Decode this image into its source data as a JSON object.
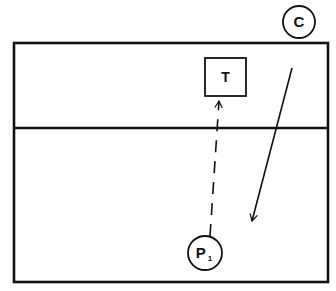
{
  "diagram": {
    "type": "court-play-diagram",
    "court": {
      "outer": {
        "x": 14,
        "y": 43,
        "width": 314,
        "height": 239
      },
      "divider_y": 128,
      "stroke": "#111111"
    },
    "players": [
      {
        "id": "C",
        "label": "C",
        "subscript": "",
        "shape": "circle",
        "cx": 299,
        "cy": 22,
        "r": 16
      },
      {
        "id": "P1",
        "label": "P",
        "subscript": "1",
        "shape": "circle",
        "cx": 205,
        "cy": 253,
        "r": 17
      }
    ],
    "targets": [
      {
        "id": "T",
        "label": "T",
        "shape": "square",
        "x": 205,
        "y": 58,
        "width": 41,
        "height": 38
      }
    ],
    "paths": [
      {
        "id": "p1-to-target",
        "from": "P1",
        "to": "T",
        "style": "dashed",
        "x1": 210,
        "y1": 236,
        "x2": 219,
        "y2": 101
      },
      {
        "id": "c-movement",
        "from": "C",
        "style": "solid",
        "x1": 292,
        "y1": 68,
        "x2": 252,
        "y2": 221
      }
    ]
  }
}
